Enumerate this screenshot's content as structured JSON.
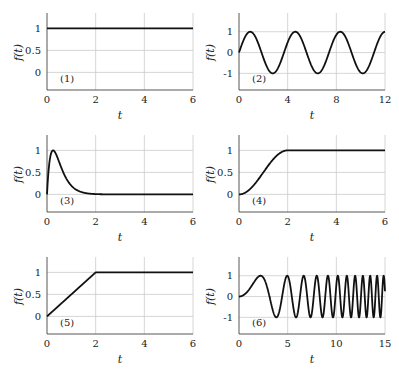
{
  "figure": {
    "width": 399,
    "height": 370,
    "line_color": "#111111",
    "grid_color": "#cccccc",
    "axis_color": "#444444"
  },
  "chart_data": [
    {
      "type": "line",
      "panel": "(1)",
      "title": "",
      "xlabel": "t",
      "ylabel": "f(t)",
      "xlim": [
        0,
        6
      ],
      "ylim": [
        -0.4,
        1.35
      ],
      "xticks": [
        0,
        2,
        4,
        6
      ],
      "yticks": [
        0,
        0.5,
        1
      ],
      "ytick_labels": [
        "0",
        "0.5",
        "1"
      ],
      "grid": true,
      "function": "step",
      "x": [
        0,
        6
      ],
      "y": [
        1,
        1
      ]
    },
    {
      "type": "line",
      "panel": "(2)",
      "title": "",
      "xlabel": "t",
      "ylabel": "f(t)",
      "xlim": [
        0,
        12
      ],
      "ylim": [
        -1.8,
        1.9
      ],
      "xticks": [
        0,
        4,
        8,
        12
      ],
      "yticks": [
        -1,
        0,
        1
      ],
      "ytick_labels": [
        "-1",
        "0",
        "1"
      ],
      "grid": true,
      "function": "sine",
      "period": 3.7,
      "x": [
        0,
        0.925,
        2.775,
        4.625,
        6.475,
        8.325,
        10.175,
        12
      ],
      "y": [
        0,
        1,
        -1,
        1,
        -1,
        1,
        -1,
        0.95
      ]
    },
    {
      "type": "line",
      "panel": "(3)",
      "title": "",
      "xlabel": "t",
      "ylabel": "f(t)",
      "xlim": [
        0,
        6
      ],
      "ylim": [
        -0.4,
        1.35
      ],
      "xticks": [
        0,
        2,
        4,
        6
      ],
      "yticks": [
        0,
        0.5,
        1
      ],
      "ytick_labels": [
        "0",
        "0.5",
        "1"
      ],
      "grid": true,
      "function": "alpha_pulse",
      "x": [
        0,
        0.25,
        0.5,
        1,
        2,
        3,
        4,
        6
      ],
      "y": [
        0,
        1.0,
        0.92,
        0.6,
        0.2,
        0.06,
        0.02,
        0.0
      ]
    },
    {
      "type": "line",
      "panel": "(4)",
      "title": "",
      "xlabel": "t",
      "ylabel": "f(t)",
      "xlim": [
        0,
        6
      ],
      "ylim": [
        -0.4,
        1.35
      ],
      "xticks": [
        0,
        2,
        4,
        6
      ],
      "yticks": [
        0,
        0.5,
        1
      ],
      "ytick_labels": [
        "0",
        "0.5",
        "1"
      ],
      "grid": true,
      "function": "smooth_ramp",
      "ramp_end": 2,
      "x": [
        0,
        0.5,
        1,
        1.5,
        2,
        6
      ],
      "y": [
        0,
        0.15,
        0.5,
        0.85,
        1,
        1
      ]
    },
    {
      "type": "line",
      "panel": "(5)",
      "title": "",
      "xlabel": "t",
      "ylabel": "f(t)",
      "xlim": [
        0,
        6
      ],
      "ylim": [
        -0.4,
        1.35
      ],
      "xticks": [
        0,
        2,
        4,
        6
      ],
      "yticks": [
        0,
        0.5,
        1
      ],
      "ytick_labels": [
        "0",
        "0.5",
        "1"
      ],
      "grid": true,
      "function": "linear_ramp",
      "ramp_end": 2,
      "x": [
        0,
        2,
        6
      ],
      "y": [
        0,
        1,
        1
      ]
    },
    {
      "type": "line",
      "panel": "(6)",
      "title": "",
      "xlabel": "t",
      "ylabel": "f(t)",
      "xlim": [
        0,
        15
      ],
      "ylim": [
        -1.8,
        1.9
      ],
      "xticks": [
        0,
        5,
        10,
        15
      ],
      "yticks": [
        -1,
        0,
        1
      ],
      "ytick_labels": [
        "-1",
        "0",
        "1"
      ],
      "grid": true,
      "function": "chirp",
      "chirp_k": 0.32,
      "x": [
        0,
        2.2,
        3.8,
        5,
        5.9
      ],
      "y": [
        0,
        1,
        -1,
        1,
        -1
      ]
    }
  ]
}
